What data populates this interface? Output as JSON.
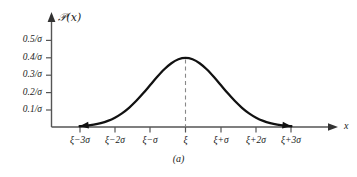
{
  "caption": "(a)",
  "chart_data": {
    "type": "line",
    "title": "",
    "subtitle": "",
    "xlabel": "x",
    "ylabel": "℘(x)",
    "ylabel_display": "𝒫(x)",
    "curve_name": "normal-distribution-density",
    "grid": false,
    "legend": null,
    "xlim": [
      -3.6,
      4.3
    ],
    "ylim": [
      0,
      0.58
    ],
    "x_tick_values": [
      -3,
      -2,
      -1,
      0,
      1,
      2,
      3
    ],
    "x_tick_labels": [
      "ξ−3σ",
      "ξ−2σ",
      "ξ−σ",
      "ξ",
      "ξ+σ",
      "ξ+2σ",
      "ξ+3σ"
    ],
    "y_tick_values": [
      0.1,
      0.2,
      0.3,
      0.4,
      0.5
    ],
    "y_tick_labels": [
      "0.1/σ",
      "0.2/σ",
      "0.3/σ",
      "0.4/σ",
      "0.5/σ"
    ],
    "peak": {
      "x": 0,
      "y": 0.3989,
      "label": "ξ"
    },
    "annotations": [
      {
        "name": "mean-dashed-line",
        "style": "dashed-vertical",
        "x": 0,
        "y_from": 0,
        "y_to": 0.3989
      }
    ],
    "x": [
      -3.0,
      -2.8,
      -2.6,
      -2.4,
      -2.2,
      -2.0,
      -1.8,
      -1.6,
      -1.4,
      -1.2,
      -1.0,
      -0.8,
      -0.6,
      -0.4,
      -0.2,
      0.0,
      0.2,
      0.4,
      0.6,
      0.8,
      1.0,
      1.2,
      1.4,
      1.6,
      1.8,
      2.0,
      2.2,
      2.4,
      2.6,
      2.8,
      3.0
    ],
    "y": [
      0.0044,
      0.0079,
      0.0136,
      0.0224,
      0.0355,
      0.054,
      0.079,
      0.1109,
      0.1497,
      0.1942,
      0.242,
      0.2897,
      0.3332,
      0.3683,
      0.391,
      0.3989,
      0.391,
      0.3683,
      0.3332,
      0.2897,
      0.242,
      0.1942,
      0.1497,
      0.1109,
      0.079,
      0.054,
      0.0355,
      0.0224,
      0.0136,
      0.0079,
      0.0044
    ],
    "colors": {
      "curve": "#111111",
      "axis": "#555555",
      "dashed": "#777777",
      "background": "#ffffff",
      "text": "#1a1a1a"
    }
  }
}
